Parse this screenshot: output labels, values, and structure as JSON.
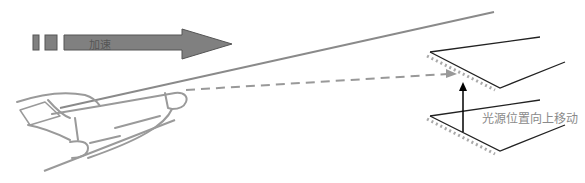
{
  "diagram": {
    "accel_arrow": {
      "label": "加速",
      "fill": "#808080",
      "stroke": "#555555"
    },
    "light_shift_label": "光源位置向上移动",
    "colors": {
      "plane_outline": "#9a9a9a",
      "dashed_ray": "#999999",
      "shadow_dots": "#aaaaaa",
      "surface_lines": "#222222",
      "up_arrow": "#000000"
    }
  }
}
